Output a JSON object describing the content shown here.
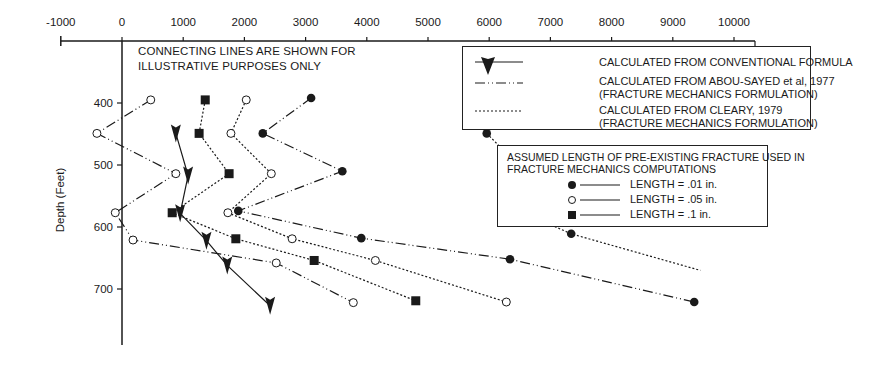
{
  "chart_data": {
    "type": "line",
    "title": "",
    "xlabel": "",
    "ylabel": "Depth (Feet)",
    "xlim": [
      -1000,
      10500
    ],
    "ylim": [
      350,
      790
    ],
    "y_inverted": true,
    "x_axis_position": "top",
    "x_ticks": [
      -1000,
      0,
      1000,
      2000,
      3000,
      4000,
      5000,
      6000,
      7000,
      8000,
      9000,
      10000
    ],
    "y_ticks": [
      400,
      500,
      600,
      700
    ],
    "grid": false,
    "annotation": "CONNECTING LINES ARE SHOWN FOR ILLUSTRATIVE PURPOSES ONLY",
    "legend_methods": [
      {
        "name": "CALCULATED FROM CONVENTIONAL FORMULA",
        "line": "solid",
        "marker": "arrowhead-down"
      },
      {
        "name": "CALCULATED FROM ABOU-SAYED et al, 1977",
        "subtitle": "(FRACTURE MECHANICS FORMULATION)",
        "line": "dash-dot"
      },
      {
        "name": "CALCULATED FROM CLEARY, 1979",
        "subtitle": "(FRACTURE MECHANICS FORMULATION)",
        "line": "dotted"
      }
    ],
    "legend_lengths": {
      "title": "ASSUMED LENGTH OF PRE-EXISTING FRACTURE USED IN FRACTURE MECHANICS COMPUTATIONS",
      "items": [
        {
          "marker": "filled-circle",
          "label": "LENGTH = .01 in."
        },
        {
          "marker": "open-circle",
          "label": "LENGTH = .05 in."
        },
        {
          "marker": "filled-square",
          "label": "LENGTH = .1 in."
        }
      ]
    },
    "series": [
      {
        "name": "Conventional formula",
        "line": "solid",
        "marker": "arrow",
        "points": [
          [
            880,
            449
          ],
          [
            1080,
            517
          ],
          [
            950,
            578
          ],
          [
            1380,
            622
          ],
          [
            1720,
            662
          ],
          [
            2420,
            727
          ]
        ]
      },
      {
        "name": "Abou-Sayed 1977, LENGTH = .05 in.",
        "line": "dash-dot",
        "marker": "open-circle",
        "points": [
          [
            470,
            395
          ],
          [
            -410,
            449
          ],
          [
            880,
            514
          ],
          [
            -110,
            577
          ],
          [
            180,
            621
          ],
          [
            2520,
            658
          ],
          [
            3780,
            722
          ]
        ]
      },
      {
        "name": "Abou-Sayed 1977, LENGTH = .01 in.",
        "line": "dash-dot",
        "marker": "filled-circle",
        "points": [
          [
            3090,
            392
          ],
          [
            2300,
            449
          ],
          [
            3600,
            510
          ],
          [
            1900,
            574
          ],
          [
            3910,
            618
          ],
          [
            6340,
            652
          ],
          [
            9350,
            721
          ]
        ]
      },
      {
        "name": "Cleary 1979, LENGTH = .1 in.",
        "line": "dotted",
        "marker": "filled-square",
        "points": [
          [
            1360,
            395
          ],
          [
            1260,
            449
          ],
          [
            1750,
            514
          ],
          [
            820,
            577
          ],
          [
            1860,
            619
          ],
          [
            3140,
            654
          ],
          [
            4800,
            719
          ]
        ]
      },
      {
        "name": "Cleary 1979, LENGTH = .05 in.",
        "line": "dotted",
        "marker": "open-circle",
        "points": [
          [
            2030,
            395
          ],
          [
            1780,
            449
          ],
          [
            2440,
            514
          ],
          [
            1730,
            577
          ],
          [
            2780,
            619
          ],
          [
            4140,
            654
          ],
          [
            6280,
            721
          ]
        ]
      },
      {
        "name": "Cleary 1979, LENGTH = .01 in.",
        "line": "dotted",
        "marker": "filled-circle",
        "points": [
          [
            6080,
            392
          ],
          [
            5960,
            449
          ],
          [
            6570,
            510
          ],
          [
            6490,
            574
          ],
          [
            7340,
            611
          ],
          [
            9450,
            670
          ]
        ]
      }
    ]
  },
  "labels": {
    "note_line1": "CONNECTING LINES ARE SHOWN FOR",
    "note_line2": "ILLUSTRATIVE PURPOSES ONLY",
    "ylabel": "Depth (Feet)",
    "legend1_conventional": "CALCULATED FROM CONVENTIONAL FORMULA",
    "legend1_abou": "CALCULATED FROM ABOU-SAYED et al, 1977",
    "legend1_abou_sub": "(FRACTURE MECHANICS FORMULATION)",
    "legend1_cleary": "CALCULATED FROM CLEARY, 1979",
    "legend1_cleary_sub": "(FRACTURE MECHANICS FORMULATION)",
    "legend2_title1": "ASSUMED LENGTH OF PRE-EXISTING FRACTURE USED IN",
    "legend2_title2": "FRACTURE MECHANICS COMPUTATIONS",
    "legend2_item1": "LENGTH  =  .01 in.",
    "legend2_item2": "LENGTH  =  .05 in.",
    "legend2_item3": "LENGTH  =  .1 in.",
    "xticks": [
      "-1000",
      "0",
      "1000",
      "2000",
      "3000",
      "4000",
      "5000",
      "6000",
      "7000",
      "8000",
      "9000",
      "10000"
    ],
    "yticks": [
      "400",
      "500",
      "600",
      "700"
    ]
  },
  "colors": {
    "ink": "#1a1a1a",
    "background": "#ffffff"
  }
}
